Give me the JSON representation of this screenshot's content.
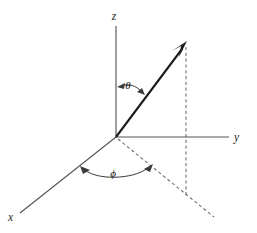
{
  "figure": {
    "background_color": "#ffffff",
    "width": 257,
    "height": 233
  },
  "axes": [
    {
      "id": "z",
      "label": "z",
      "description": "vertical axis pointing up from origin",
      "color": "#555555",
      "label_x": 114,
      "label_y": 20
    },
    {
      "id": "y",
      "label": "y",
      "description": "horizontal axis pointing right from origin",
      "color": "#555555",
      "label_x": 234,
      "label_y": 141
    },
    {
      "id": "x",
      "label": "x",
      "description": "oblique axis pointing down-left toward viewer",
      "color": "#555555",
      "label_x": 8,
      "label_y": 221
    }
  ],
  "vector": {
    "label": "radius vector",
    "color": "#1a1a1a",
    "origin": [
      116,
      137
    ],
    "tip": [
      186,
      43
    ]
  },
  "projection": {
    "vertical_drop": {
      "description": "dashed vertical line from vector tip down to xy-plane",
      "from": [
        186,
        46
      ],
      "to": [
        186,
        196
      ],
      "color": "#6b6b6b"
    },
    "ground_line": {
      "description": "dashed line in xy-plane from origin through projection point",
      "from": [
        116,
        137
      ],
      "to": [
        213,
        216
      ],
      "color": "#6b6b6b"
    }
  },
  "angles": [
    {
      "id": "theta",
      "symbol": "θ",
      "description": "polar angle between z-axis and radius vector",
      "label_x": 128,
      "label_y": 89,
      "color": "#111111"
    },
    {
      "id": "phi",
      "symbol": "ϕ",
      "description": "azimuthal angle between x-axis and projection of vector in xy-plane",
      "label_x": 113,
      "label_y": 177,
      "color": "#111111"
    }
  ]
}
